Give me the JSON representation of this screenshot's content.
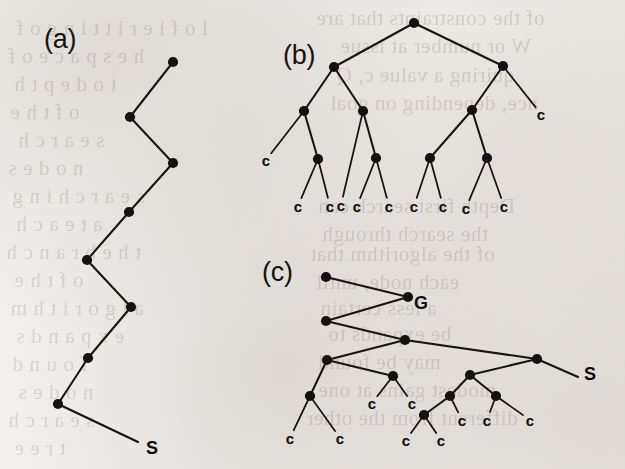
{
  "figure": {
    "caption_absent": true,
    "background_color": "#f1efed",
    "ink_color": "#17130f",
    "width": 625,
    "height": 469,
    "panels": [
      {
        "id": "a",
        "label": "(a)",
        "label_x": 44,
        "label_y": 26,
        "description": "zigzag search path (single chain of nodes) ending at start node S"
      },
      {
        "id": "b",
        "label": "(b)",
        "label_x": 283,
        "label_y": 42,
        "description": "binary search tree expanded from root with cutoff leaves labelled c"
      },
      {
        "id": "c",
        "label": "(c)",
        "label_x": 262,
        "label_y": 259,
        "description": "combined path and tree: zigzag path through G out to S with subtrees of cutoff leaves c"
      }
    ],
    "point_labels": [
      {
        "text": "S",
        "x": 152,
        "y": 448,
        "panel": "a",
        "name": "start-node-label-a"
      },
      {
        "text": "G",
        "x": 421,
        "y": 303,
        "panel": "c",
        "name": "goal-node-label-c"
      },
      {
        "text": "S",
        "x": 590,
        "y": 374,
        "panel": "c",
        "name": "start-node-label-c"
      }
    ],
    "leaf_label_text": "c",
    "node_radius": 5.1,
    "node_radius_small": 4.4
  },
  "chart_data": {
    "type": "diagram",
    "panels": [
      {
        "id": "a",
        "label": "(a)",
        "kind": "path",
        "nodes": [
          {
            "id": "a0",
            "x": 173,
            "y": 62
          },
          {
            "id": "a1",
            "x": 130,
            "y": 117
          },
          {
            "id": "a2",
            "x": 173,
            "y": 163
          },
          {
            "id": "a3",
            "x": 129,
            "y": 212
          },
          {
            "id": "a4",
            "x": 87,
            "y": 260
          },
          {
            "id": "a5",
            "x": 131,
            "y": 307
          },
          {
            "id": "a6",
            "x": 88,
            "y": 358
          },
          {
            "id": "a7",
            "x": 58,
            "y": 404
          }
        ],
        "edges": [
          [
            "a0",
            "a1"
          ],
          [
            "a1",
            "a2"
          ],
          [
            "a2",
            "a3"
          ],
          [
            "a3",
            "a4"
          ],
          [
            "a4",
            "a5"
          ],
          [
            "a5",
            "a6"
          ],
          [
            "a6",
            "a7"
          ]
        ],
        "tail": {
          "from": "a7",
          "x": 138,
          "y": 442
        },
        "leaves": []
      },
      {
        "id": "b",
        "label": "(b)",
        "kind": "binary-tree",
        "nodes": [
          {
            "id": "b0",
            "x": 414,
            "y": 23
          },
          {
            "id": "b1",
            "x": 334,
            "y": 67
          },
          {
            "id": "b2",
            "x": 503,
            "y": 66
          },
          {
            "id": "b3",
            "x": 304,
            "y": 111
          },
          {
            "id": "b4",
            "x": 363,
            "y": 111
          },
          {
            "id": "b5",
            "x": 472,
            "y": 110
          },
          {
            "id": "b6",
            "x": 318,
            "y": 159
          },
          {
            "id": "b7",
            "x": 376,
            "y": 158
          },
          {
            "id": "b8",
            "x": 430,
            "y": 158
          },
          {
            "id": "b9",
            "x": 487,
            "y": 158
          }
        ],
        "edges": [
          [
            "b0",
            "b1"
          ],
          [
            "b0",
            "b2"
          ],
          [
            "b1",
            "b3"
          ],
          [
            "b1",
            "b4"
          ],
          [
            "b2",
            "b5"
          ],
          [
            "b3",
            "b6"
          ],
          [
            "b4",
            "b7"
          ],
          [
            "b5",
            "b8"
          ],
          [
            "b5",
            "b9"
          ]
        ],
        "leaves": [
          {
            "parent": "b3",
            "x": 266,
            "y": 160
          },
          {
            "parent": "b2",
            "x": 541,
            "y": 114
          },
          {
            "parent": "b4",
            "x": 341,
            "y": 205
          },
          {
            "parent": "b6",
            "x": 298,
            "y": 206
          },
          {
            "parent": "b6",
            "x": 330,
            "y": 206
          },
          {
            "parent": "b7",
            "x": 357,
            "y": 206
          },
          {
            "parent": "b7",
            "x": 389,
            "y": 206
          },
          {
            "parent": "b8",
            "x": 414,
            "y": 206
          },
          {
            "parent": "b8",
            "x": 443,
            "y": 206
          },
          {
            "parent": "b9",
            "x": 466,
            "y": 208
          },
          {
            "parent": "b9",
            "x": 504,
            "y": 206
          }
        ]
      },
      {
        "id": "c",
        "label": "(c)",
        "kind": "path-with-subtrees",
        "nodes": [
          {
            "id": "c0",
            "x": 326,
            "y": 277
          },
          {
            "id": "c1",
            "x": 408,
            "y": 297
          },
          {
            "id": "c2",
            "x": 326,
            "y": 321
          },
          {
            "id": "c3",
            "x": 405,
            "y": 340,
            "label": "G"
          },
          {
            "id": "c4",
            "x": 327,
            "y": 360
          },
          {
            "id": "c5",
            "x": 537,
            "y": 359
          },
          {
            "id": "c6",
            "x": 310,
            "y": 396
          },
          {
            "id": "c7",
            "x": 393,
            "y": 376
          },
          {
            "id": "c8",
            "x": 470,
            "y": 375
          },
          {
            "id": "c9",
            "x": 450,
            "y": 396
          },
          {
            "id": "c10",
            "x": 496,
            "y": 396
          },
          {
            "id": "c11",
            "x": 424,
            "y": 415
          }
        ],
        "edges": [
          [
            "c0",
            "c1"
          ],
          [
            "c1",
            "c2"
          ],
          [
            "c2",
            "c3"
          ],
          [
            "c3",
            "c4"
          ],
          [
            "c3",
            "c5"
          ],
          [
            "c4",
            "c6"
          ],
          [
            "c4",
            "c7"
          ],
          [
            "c5",
            "c8"
          ],
          [
            "c8",
            "c9"
          ],
          [
            "c8",
            "c10"
          ],
          [
            "c9",
            "c11"
          ]
        ],
        "tail": {
          "from": "c5",
          "x": 578,
          "y": 377
        },
        "leaves": [
          {
            "parent": "c6",
            "x": 290,
            "y": 438
          },
          {
            "parent": "c6",
            "x": 340,
            "y": 438
          },
          {
            "parent": "c7",
            "x": 372,
            "y": 403
          },
          {
            "parent": "c7",
            "x": 412,
            "y": 403
          },
          {
            "parent": "c9",
            "x": 462,
            "y": 420
          },
          {
            "parent": "c10",
            "x": 487,
            "y": 420
          },
          {
            "parent": "c10",
            "x": 530,
            "y": 420
          },
          {
            "parent": "c11",
            "x": 406,
            "y": 440
          },
          {
            "parent": "c11",
            "x": 441,
            "y": 440
          }
        ]
      }
    ]
  },
  "bleed_through": [
    {
      "text": "of the constraints that are",
      "x": 316,
      "y": 6
    },
    {
      "text": "W or number at issue",
      "x": 340,
      "y": 34
    },
    {
      "text": "quiring a value c, Q",
      "x": 336,
      "y": 63
    },
    {
      "text": "nce, depending on goal",
      "x": 330,
      "y": 91
    },
    {
      "text": "Depth first search can",
      "x": 318,
      "y": 194
    },
    {
      "text": "the search through",
      "x": 322,
      "y": 222
    },
    {
      "text": "of the algorithm that",
      "x": 310,
      "y": 242
    },
    {
      "text": "each node, until",
      "x": 316,
      "y": 270
    },
    {
      "text": "a less certain",
      "x": 320,
      "y": 296
    },
    {
      "text": "be expands to",
      "x": 328,
      "y": 322
    },
    {
      "text": "may be found",
      "x": 318,
      "y": 350
    },
    {
      "text": "modest gains at one",
      "x": 318,
      "y": 378
    },
    {
      "text": "different from the other",
      "x": 306,
      "y": 406
    },
    {
      "text": "l o f i e r i t t i n g o f",
      "x": 16,
      "y": 16
    },
    {
      "text": "h e s p a c e o f",
      "x": 8,
      "y": 44
    },
    {
      "text": "t o d e p t h",
      "x": 14,
      "y": 72
    },
    {
      "text": "o f t h e",
      "x": 10,
      "y": 100
    },
    {
      "text": "s e a r c h",
      "x": 18,
      "y": 128
    },
    {
      "text": "n o d e s",
      "x": 8,
      "y": 156
    },
    {
      "text": "s e a r c h i n g",
      "x": 12,
      "y": 184
    },
    {
      "text": "a t e a c h",
      "x": 16,
      "y": 212
    },
    {
      "text": "t h e b r a n c h",
      "x": 6,
      "y": 240
    },
    {
      "text": "o f t h e",
      "x": 14,
      "y": 268
    },
    {
      "text": "a l g o r i t h m",
      "x": 10,
      "y": 296
    },
    {
      "text": "e x p a n d s",
      "x": 16,
      "y": 324
    },
    {
      "text": "f o u n d",
      "x": 12,
      "y": 352
    },
    {
      "text": "n o d e s",
      "x": 18,
      "y": 380
    },
    {
      "text": "s e a r c h",
      "x": 8,
      "y": 408
    },
    {
      "text": "t r e e",
      "x": 14,
      "y": 436
    }
  ]
}
